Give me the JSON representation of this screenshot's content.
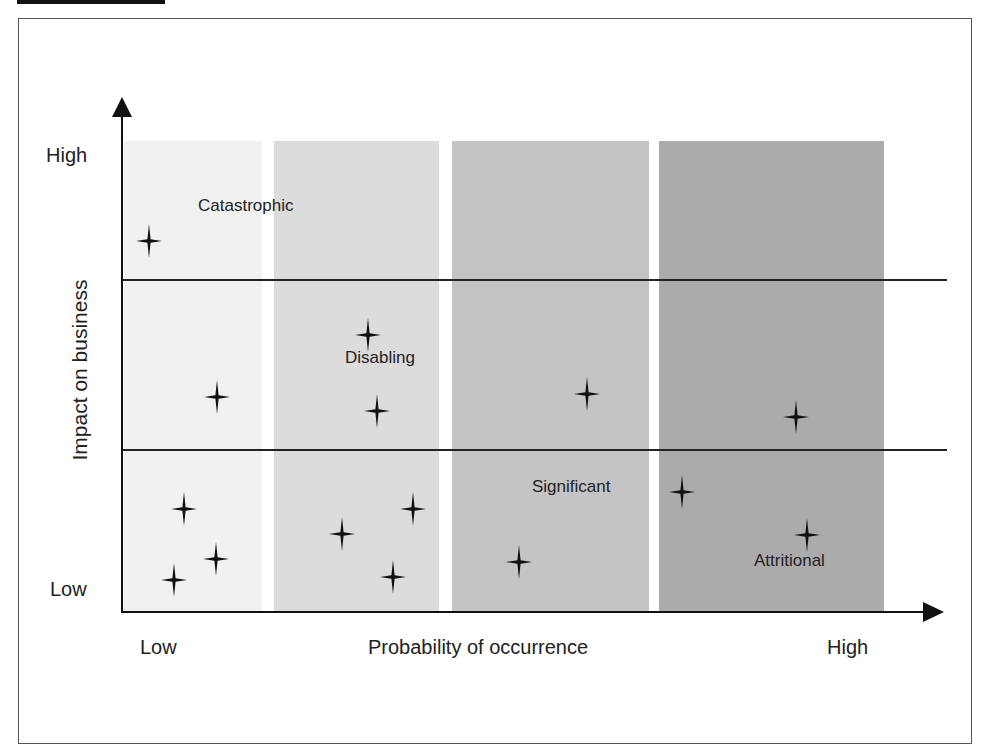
{
  "chart_data": {
    "type": "scatter",
    "title": "",
    "xlabel": "Probability of occurrence",
    "ylabel": "Impact on business",
    "x_ticks": [
      "Low",
      "High"
    ],
    "y_ticks": [
      "High",
      "Low"
    ],
    "zones": [
      {
        "name": "Catastrophic",
        "region": "top band (high impact)"
      },
      {
        "name": "Disabling",
        "region": "middle band"
      },
      {
        "name": "Significant",
        "region": "lower-middle, mid-high probability"
      },
      {
        "name": "Attritional",
        "region": "low impact, high probability"
      }
    ],
    "probability_bands": [
      {
        "label": "band-1",
        "shade": "#f1f1f1"
      },
      {
        "label": "band-2",
        "shade": "#dcdcdc"
      },
      {
        "label": "band-3",
        "shade": "#c4c4c4"
      },
      {
        "label": "band-4",
        "shade": "#ababab"
      }
    ],
    "points_note": "Star markers, positions in relative units (x: 0=low..1=high probability, y: 0=low..1=high impact)",
    "points": [
      {
        "x": 0.04,
        "y": 0.8
      },
      {
        "x": 0.21,
        "y": 0.45
      },
      {
        "x": 0.3,
        "y": 0.59
      },
      {
        "x": 0.31,
        "y": 0.43
      },
      {
        "x": 0.58,
        "y": 0.45
      },
      {
        "x": 0.86,
        "y": 0.42
      },
      {
        "x": 0.08,
        "y": 0.22
      },
      {
        "x": 0.12,
        "y": 0.11
      },
      {
        "x": 0.06,
        "y": 0.07
      },
      {
        "x": 0.27,
        "y": 0.16
      },
      {
        "x": 0.36,
        "y": 0.22
      },
      {
        "x": 0.33,
        "y": 0.07
      },
      {
        "x": 0.48,
        "y": 0.1
      },
      {
        "x": 0.7,
        "y": 0.25
      },
      {
        "x": 0.84,
        "y": 0.16
      }
    ],
    "threshold_lines": [
      "catastrophic/disabling boundary",
      "disabling/significant boundary"
    ],
    "grid": false,
    "legend": "none"
  },
  "labels": {
    "y_high": "High",
    "y_low": "Low",
    "x_low": "Low",
    "x_high": "High",
    "x_axis_title": "Probability of occurrence",
    "y_axis_title": "Impact on business",
    "zone_catastrophic": "Catastrophic",
    "zone_disabling": "Disabling",
    "zone_significant": "Significant",
    "zone_attritional": "Attritional"
  },
  "colors": {
    "band1": "#f1f1f1",
    "band2": "#dcdcdc",
    "band3": "#c4c4c4",
    "band4": "#ababab",
    "axis": "#111111"
  },
  "marker_positions_px": [
    [
      149,
      241
    ],
    [
      217,
      397
    ],
    [
      368,
      335
    ],
    [
      377,
      411
    ],
    [
      587,
      394
    ],
    [
      796,
      417
    ],
    [
      184,
      509
    ],
    [
      216,
      559
    ],
    [
      174,
      580
    ],
    [
      342,
      534
    ],
    [
      413,
      509
    ],
    [
      393,
      577
    ],
    [
      519,
      562
    ],
    [
      682,
      492
    ],
    [
      807,
      535
    ]
  ]
}
